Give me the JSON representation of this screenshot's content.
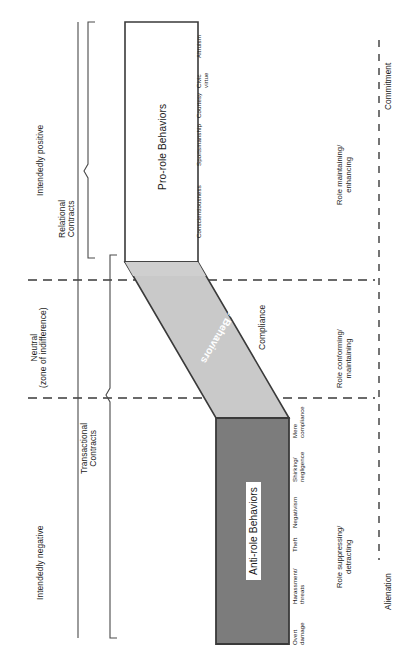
{
  "figure": {
    "orientation": "rotated-90-ccw",
    "colors": {
      "anti_role_fill": "#7c7c7c",
      "role_band_fill": "#c9c9c9",
      "pro_role_fill": "#ffffff",
      "outline": "#3a3a3a",
      "dashed": "#3a3a3a",
      "text": "#1a1a1a"
    }
  },
  "valence_axis": {
    "name": "intent-valence-axis",
    "labels": [
      {
        "text": "Intendedly positive"
      },
      {
        "line1": "Neutral",
        "line2": "(zone of indifference)"
      },
      {
        "text": "Intendedly negative"
      }
    ]
  },
  "contract_brackets": [
    {
      "line1": "Relational",
      "line2": "Contracts"
    },
    {
      "line1": "Transactional",
      "line2": "Contracts"
    }
  ],
  "shapes": {
    "pro_role": {
      "label": "Pro-role Behaviors"
    },
    "role_band": {
      "label": "Role Behaviors"
    },
    "anti_role": {
      "label": "Anti-role Behaviors"
    }
  },
  "behavior_examples": {
    "pro_role": [
      {
        "line1": "Conscientiousness",
        "line2": ""
      },
      {
        "line1": "Sportsmanship",
        "line2": ""
      },
      {
        "line1": "Courtesy",
        "line2": ""
      },
      {
        "line1": "Civic",
        "line2": "virtue"
      },
      {
        "line1": "Altruism",
        "line2": ""
      }
    ],
    "compliance": {
      "label": "Compliance"
    },
    "anti_role": [
      {
        "line1": "Overt",
        "line2": "damage"
      },
      {
        "line1": "Harassment/",
        "line2": "threats"
      },
      {
        "line1": "Theft",
        "line2": ""
      },
      {
        "line1": "Negativism",
        "line2": ""
      },
      {
        "line1": "Shirking/",
        "line2": "negligence"
      },
      {
        "line1": "Mere",
        "line2": "compliance"
      }
    ]
  },
  "role_outcomes": [
    {
      "line1": "Role maintaining/",
      "line2": "enhancing"
    },
    {
      "line1": "Role conforming/",
      "line2": "maintaining"
    },
    {
      "line1": "Role suppressing/",
      "line2": "detracting"
    }
  ],
  "attachment_axis": {
    "left_label": "Alienation",
    "right_label": "Commitment"
  }
}
